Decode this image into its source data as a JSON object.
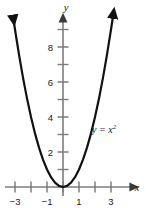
{
  "chart_data": {
    "type": "line",
    "title": "",
    "subtitle": "",
    "xlabel": "x",
    "ylabel": "y",
    "function_label": "y = x",
    "function_label_exponent": "2",
    "equation": "y = x^2",
    "xlim": [
      -3.5,
      3.7
    ],
    "ylim": [
      -0.6,
      9.8
    ],
    "grid": false,
    "legend": "none",
    "x_tick_values": [
      -3,
      -2,
      -1,
      0,
      1,
      2,
      3
    ],
    "x_tick_labels": [
      "−3",
      "",
      "−1",
      "",
      "1",
      "",
      "3"
    ],
    "y_tick_values": [
      1,
      2,
      3,
      4,
      5,
      6,
      7,
      8,
      9
    ],
    "y_tick_labels": [
      "",
      "2",
      "",
      "4",
      "",
      "6",
      "",
      "8",
      ""
    ],
    "series": [
      {
        "name": "y = x^2",
        "color": "#111111",
        "x": [
          -3.12,
          -3.0,
          -2.75,
          -2.5,
          -2.25,
          -2.0,
          -1.75,
          -1.5,
          -1.25,
          -1.0,
          -0.75,
          -0.5,
          -0.25,
          0,
          0.25,
          0.5,
          0.75,
          1.0,
          1.25,
          1.5,
          1.75,
          2.0,
          2.25,
          2.5,
          2.75,
          3.0,
          3.12
        ],
        "values": [
          9.73,
          9.0,
          7.5625,
          6.25,
          5.0625,
          4.0,
          3.0625,
          2.25,
          1.5625,
          1.0,
          0.5625,
          0.25,
          0.0625,
          0,
          0.0625,
          0.25,
          0.5625,
          1.0,
          1.5625,
          2.25,
          3.0625,
          4.0,
          5.0625,
          6.25,
          7.5625,
          9.0,
          9.73
        ],
        "arrow_start": true,
        "arrow_end": true
      }
    ],
    "axis_color": "#7d7d7d",
    "curve_color": "#111111",
    "text_color": "#1a1a1a",
    "background_color": "#ffffff"
  }
}
